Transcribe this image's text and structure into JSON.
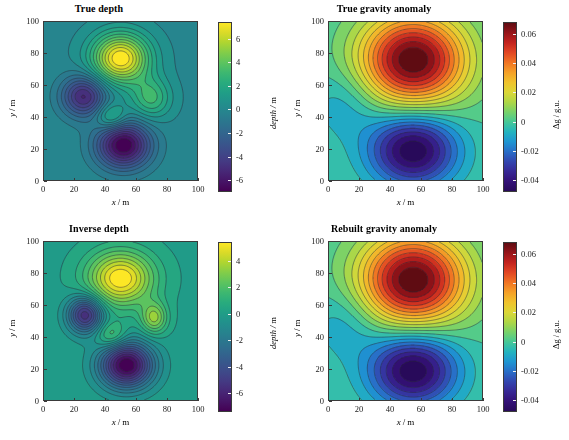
{
  "figure": {
    "background": "#ffffff",
    "panel_count": 4
  },
  "axis": {
    "xlabel_var": "x",
    "xlabel_unit": "m",
    "ylabel_var": "y",
    "ylabel_unit": "m",
    "separator": "/",
    "x_ticks": [
      "0",
      "20",
      "40",
      "60",
      "80",
      "100"
    ],
    "y_ticks": [
      "0",
      "20",
      "40",
      "60",
      "80",
      "100"
    ],
    "xlim": [
      0,
      100
    ],
    "ylim": [
      0,
      100
    ]
  },
  "panels": [
    {
      "id": "true-depth",
      "title": "True depth",
      "colorbar": {
        "label_var": "depth",
        "label_unit": "m",
        "ticks": [
          "6",
          "4",
          "2",
          "0",
          "-2",
          "-4",
          "-6"
        ],
        "tick_values": [
          6,
          4,
          2,
          0,
          -2,
          -4,
          -6
        ],
        "vmin": -7.0,
        "vmax": 7.4,
        "colormap": "viridis"
      }
    },
    {
      "id": "true-gravity-anomaly",
      "title": "True gravity anomaly",
      "colorbar": {
        "label_var": "Δg",
        "label_unit": "g.u.",
        "ticks": [
          "0.06",
          "0.04",
          "0.02",
          "0",
          "-0.02",
          "-0.04"
        ],
        "tick_values": [
          0.06,
          0.04,
          0.02,
          0,
          -0.02,
          -0.04
        ],
        "vmin": -0.048,
        "vmax": 0.068,
        "colormap": "jet"
      }
    },
    {
      "id": "inverse-depth",
      "title": "Inverse depth",
      "colorbar": {
        "label_var": "depth",
        "label_unit": "m",
        "ticks": [
          "4",
          "2",
          "0",
          "-2",
          "-4",
          "-6"
        ],
        "tick_values": [
          4,
          2,
          0,
          -2,
          -4,
          -6
        ],
        "vmin": -7.4,
        "vmax": 5.4,
        "colormap": "viridis"
      }
    },
    {
      "id": "rebuilt-gravity-anomaly",
      "title": "Rebuilt gravity anomaly",
      "colorbar": {
        "label_var": "Δg",
        "label_unit": "g.u.",
        "ticks": [
          "0.06",
          "0.04",
          "0.02",
          "0",
          "-0.02",
          "-0.04"
        ],
        "tick_values": [
          0.06,
          0.04,
          0.02,
          0,
          -0.02,
          -0.04
        ],
        "vmin": -0.048,
        "vmax": 0.068,
        "colormap": "jet"
      }
    }
  ],
  "chart_data": [
    {
      "type": "heatmap",
      "panel": "true-depth",
      "title": "True depth",
      "xlabel": "x / m",
      "ylabel": "y / m",
      "zlabel": "depth / m",
      "xlim": [
        0,
        100
      ],
      "ylim": [
        0,
        100
      ],
      "zlim": [
        -7.0,
        7.4
      ],
      "colormap": "viridis",
      "grid": false,
      "contour_lines": true,
      "background_value": 0.0,
      "features": [
        {
          "name": "main positive dome",
          "cx": 50,
          "cy": 77,
          "amp": 7.4,
          "sx": 13,
          "sy": 11
        },
        {
          "name": "main negative basin",
          "cx": 52,
          "cy": 22,
          "amp": -7.0,
          "sx": 12,
          "sy": 10
        },
        {
          "name": "left negative basin",
          "cx": 26,
          "cy": 53,
          "amp": -5.2,
          "sx": 10,
          "sy": 9
        },
        {
          "name": "right positive lobe",
          "cx": 70,
          "cy": 52,
          "amp": 3.0,
          "sx": 9,
          "sy": 9
        },
        {
          "name": "central small positive",
          "cx": 44,
          "cy": 40,
          "amp": 2.8,
          "sx": 7,
          "sy": 6
        }
      ]
    },
    {
      "type": "heatmap",
      "panel": "true-gravity-anomaly",
      "title": "True gravity anomaly",
      "xlabel": "x / m",
      "ylabel": "y / m",
      "zlabel": "Δg / g.u.",
      "xlim": [
        0,
        100
      ],
      "ylim": [
        0,
        100
      ],
      "zlim": [
        -0.048,
        0.068
      ],
      "colormap": "jet",
      "grid": false,
      "contour_lines": true,
      "background_value": 0.0,
      "features": [
        {
          "name": "positive anomaly high",
          "cx": 55,
          "cy": 76,
          "amp": 0.068,
          "sx": 24,
          "sy": 20
        },
        {
          "name": "negative anomaly low",
          "cx": 55,
          "cy": 19,
          "amp": -0.048,
          "sx": 20,
          "sy": 16
        },
        {
          "name": "weak left low",
          "cx": 10,
          "cy": 48,
          "amp": -0.01,
          "sx": 16,
          "sy": 16
        }
      ]
    },
    {
      "type": "heatmap",
      "panel": "inverse-depth",
      "title": "Inverse depth",
      "xlabel": "x / m",
      "ylabel": "y / m",
      "zlabel": "depth / m",
      "xlim": [
        0,
        100
      ],
      "ylim": [
        0,
        100
      ],
      "zlim": [
        -7.4,
        5.4
      ],
      "colormap": "viridis",
      "grid": false,
      "contour_lines": true,
      "background_value": 0.0,
      "features": [
        {
          "name": "main positive dome",
          "cx": 50,
          "cy": 77,
          "amp": 5.4,
          "sx": 15,
          "sy": 12
        },
        {
          "name": "main negative basin",
          "cx": 54,
          "cy": 22,
          "amp": -7.4,
          "sx": 12,
          "sy": 10
        },
        {
          "name": "left negative basin",
          "cx": 27,
          "cy": 54,
          "amp": -5.6,
          "sx": 8,
          "sy": 8
        },
        {
          "name": "right positive lobe",
          "cx": 72,
          "cy": 52,
          "amp": 3.2,
          "sx": 6,
          "sy": 7
        },
        {
          "name": "central small positive",
          "cx": 44,
          "cy": 41,
          "amp": 2.2,
          "sx": 7,
          "sy": 6
        }
      ]
    },
    {
      "type": "heatmap",
      "panel": "rebuilt-gravity-anomaly",
      "title": "Rebuilt gravity anomaly",
      "xlabel": "x / m",
      "ylabel": "y / m",
      "zlabel": "Δg / g.u.",
      "xlim": [
        0,
        100
      ],
      "ylim": [
        0,
        100
      ],
      "zlim": [
        -0.048,
        0.068
      ],
      "colormap": "jet",
      "grid": false,
      "contour_lines": true,
      "background_value": 0.0,
      "features": [
        {
          "name": "positive anomaly high",
          "cx": 55,
          "cy": 76,
          "amp": 0.068,
          "sx": 24,
          "sy": 20
        },
        {
          "name": "negative anomaly low",
          "cx": 55,
          "cy": 19,
          "amp": -0.048,
          "sx": 20,
          "sy": 16
        },
        {
          "name": "weak left low",
          "cx": 10,
          "cy": 48,
          "amp": -0.01,
          "sx": 16,
          "sy": 16
        }
      ]
    }
  ]
}
